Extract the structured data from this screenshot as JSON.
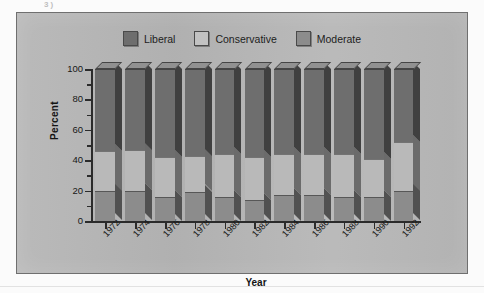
{
  "figure": {
    "background_color": "#b6b6b6",
    "scan_artifact_text": "3)",
    "legend": {
      "position": "top-center",
      "items": [
        {
          "label": "Liberal",
          "color": "#6e6e6e",
          "swatch_name": "legend-swatch-liberal"
        },
        {
          "label": "Conservative",
          "color": "#b9b9b9",
          "swatch_name": "legend-swatch-conservative"
        },
        {
          "label": "Moderate",
          "color": "#8c8c8c",
          "swatch_name": "legend-swatch-moderate"
        }
      ]
    }
  },
  "chart_data": {
    "type": "bar",
    "subtype": "100% stacked column (3D)",
    "title": "",
    "xlabel": "Year",
    "ylabel": "Percent",
    "ylim": [
      0,
      100
    ],
    "ytick_values": [
      0,
      20,
      40,
      60,
      80,
      100
    ],
    "ytick_labels": [
      "0",
      "20",
      "40",
      "60",
      "80",
      "100"
    ],
    "minor_tick_interval": 10,
    "grid": false,
    "legend_position": "top-center",
    "categories": [
      "1972",
      "1974",
      "1976",
      "1978",
      "1980",
      "1982",
      "1984",
      "1986",
      "1988",
      "1990",
      "1992"
    ],
    "stack_order_bottom_to_top": [
      "Moderate",
      "Conservative",
      "Liberal"
    ],
    "series": [
      {
        "name": "Moderate",
        "color": "#8c8c8c",
        "values": [
          20,
          20,
          16,
          19,
          16,
          14,
          17,
          17,
          16,
          16,
          20
        ]
      },
      {
        "name": "Conservative",
        "color": "#b9b9b9",
        "values": [
          26,
          27,
          26,
          24,
          28,
          28,
          27,
          27,
          28,
          25,
          32
        ]
      },
      {
        "name": "Liberal",
        "color": "#6e6e6e",
        "values": [
          54,
          53,
          58,
          57,
          56,
          58,
          56,
          56,
          56,
          59,
          48
        ]
      }
    ],
    "cumulative_tops": {
      "Moderate": [
        20,
        20,
        16,
        19,
        16,
        14,
        17,
        17,
        16,
        16,
        20
      ],
      "Conservative": [
        46,
        47,
        42,
        43,
        44,
        42,
        44,
        44,
        44,
        41,
        52
      ],
      "Liberal": [
        100,
        100,
        100,
        100,
        100,
        100,
        100,
        100,
        100,
        100,
        100
      ]
    }
  }
}
